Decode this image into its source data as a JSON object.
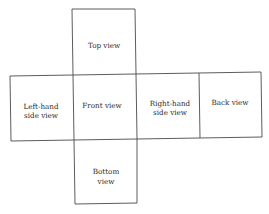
{
  "diagram": {
    "type": "cube-net-orthographic-views",
    "views": {
      "top": {
        "line1": "Top view"
      },
      "left": {
        "line1": "Left-hand",
        "line2": "side view"
      },
      "front": {
        "line1": "Front view"
      },
      "right": {
        "line1": "Right-hand",
        "line2": "side view"
      },
      "back": {
        "line1": "Back view"
      },
      "bottom": {
        "line1": "Bottom",
        "line2": "view"
      }
    },
    "colors": {
      "line": "#4a4a4a",
      "text": "#2b2b2b",
      "background": "#ffffff"
    }
  }
}
